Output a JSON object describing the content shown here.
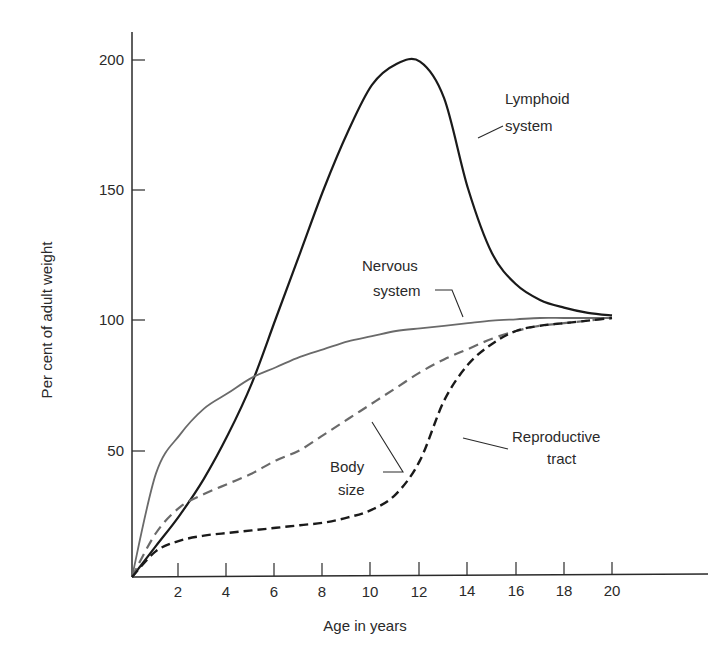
{
  "chart_data": {
    "type": "line",
    "title": "",
    "xlabel": "Age in years",
    "ylabel": "Per cent of adult weight",
    "xlim": [
      0,
      24
    ],
    "ylim": [
      0,
      210
    ],
    "x_ticks": [
      2,
      4,
      6,
      8,
      10,
      12,
      14,
      16,
      18,
      20
    ],
    "y_ticks": [
      50,
      100,
      150,
      200
    ],
    "grid": false,
    "legend": "inline annotations",
    "x": [
      0,
      1,
      2,
      3,
      4,
      5,
      6,
      7,
      8,
      9,
      10,
      11,
      12,
      13,
      14,
      15,
      16,
      17,
      18,
      19,
      20
    ],
    "series": [
      {
        "name": "Lymphoid system",
        "style": "solid-dark",
        "values": [
          0,
          12,
          24,
          38,
          55,
          75,
          100,
          125,
          150,
          172,
          190,
          198,
          199,
          185,
          150,
          125,
          113,
          107,
          104,
          102,
          101
        ]
      },
      {
        "name": "Nervous system",
        "style": "solid-gray",
        "values": [
          0,
          40,
          55,
          65,
          71,
          77,
          81,
          85,
          88,
          91,
          93,
          95,
          96,
          97,
          98,
          99,
          99.5,
          100,
          100,
          100,
          100
        ]
      },
      {
        "name": "Body size",
        "style": "dashed-gray",
        "values": [
          0,
          17,
          27,
          32,
          36,
          40,
          45,
          49,
          55,
          61,
          67,
          73,
          79,
          84,
          88,
          92,
          95,
          97,
          98,
          99,
          100
        ]
      },
      {
        "name": "Reproductive tract",
        "style": "dashed-dark",
        "values": [
          0,
          10,
          14,
          16,
          17,
          18,
          19,
          20,
          21,
          23,
          26,
          32,
          45,
          68,
          82,
          90,
          95,
          97,
          98,
          99,
          100
        ]
      }
    ],
    "annotations": [
      {
        "text": [
          "Lymphoid",
          "system"
        ]
      },
      {
        "text": [
          "Nervous",
          "system"
        ]
      },
      {
        "text": [
          "Body",
          "size"
        ]
      },
      {
        "text": [
          "Reproductive",
          "tract"
        ]
      }
    ]
  },
  "colors": {
    "axis": "#2a2a2a",
    "lymphoid": "#1a1a1a",
    "nervous": "#6a6a6a",
    "body": "#6a6a6a",
    "reproductive": "#1a1a1a"
  }
}
